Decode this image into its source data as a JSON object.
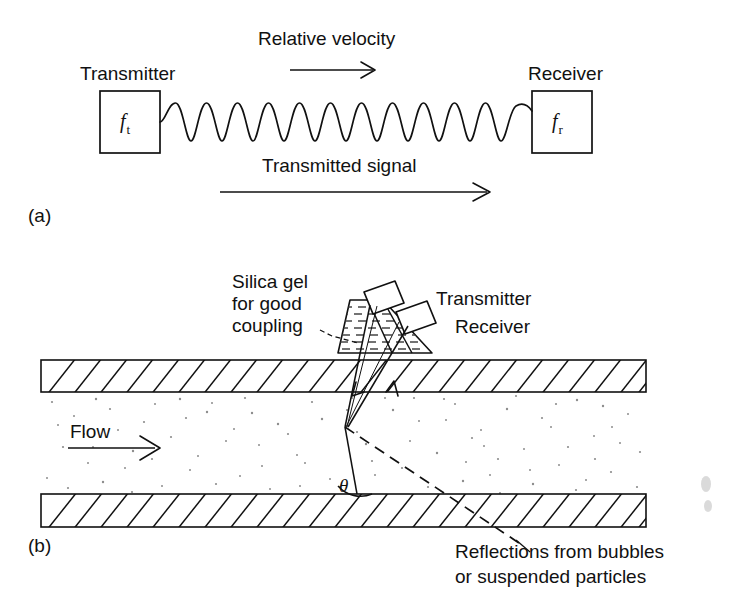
{
  "figure": {
    "ink_color": "#111111",
    "background_color": "#ffffff",
    "speckle_color": "#8d8d8d"
  },
  "panel_a": {
    "tag": "(a)",
    "transmitter_label": "Transmitter",
    "receiver_label": "Receiver",
    "transmitter_symbol": "f",
    "transmitter_subscript": "t",
    "receiver_symbol": "f",
    "receiver_subscript": "r",
    "top_arrow_label": "Relative velocity",
    "bottom_arrow_label": "Transmitted signal",
    "wave_cycles": 6
  },
  "panel_b": {
    "tag": "(b)",
    "silica_label_line1": "Silica gel",
    "silica_label_line2": "for good",
    "silica_label_line3": "coupling",
    "transmitter_label": "Transmitter",
    "receiver_label": "Receiver",
    "flow_label": "Flow",
    "angle_symbol": "θ",
    "reflection_label_line1": "Reflections from bubbles",
    "reflection_label_line2": "or suspended particles"
  }
}
